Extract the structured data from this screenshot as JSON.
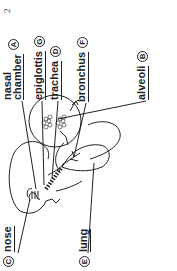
{
  "page_number": "2",
  "labels": {
    "nasal_chamber": {
      "letter": "A",
      "text_line1": "nasal",
      "text_line2": "chamber"
    },
    "alveoli": {
      "letter": "B",
      "text": "alveoli"
    },
    "nose": {
      "letter": "C",
      "text": "nose"
    },
    "trachea": {
      "letter": "D",
      "text": "trachea"
    },
    "lung": {
      "letter": "E",
      "text": "lung"
    },
    "bronchus": {
      "letter": "F",
      "text": "bronchus"
    },
    "epiglottis": {
      "letter": "G",
      "text": "epiglottis"
    }
  },
  "orientation": "rotated 90 degrees counter-clockwise"
}
